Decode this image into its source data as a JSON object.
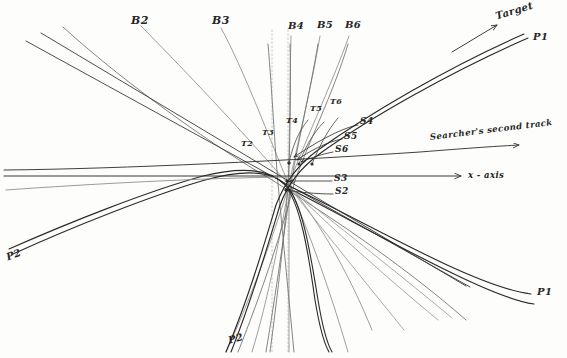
{
  "figure": {
    "kind": "hand-drawn-diagram",
    "background_color": "#fdfdfc",
    "ink_color": "#2a2a2a",
    "faint_ink_color": "#8d8d8d",
    "dotted_ink_color": "#b0b0b0",
    "width": 567,
    "height": 358
  },
  "labels": {
    "bearings": [
      {
        "name": "B2",
        "text": "B2",
        "x": 131,
        "y": 14
      },
      {
        "name": "B3",
        "text": "B3",
        "x": 212,
        "y": 14
      },
      {
        "name": "B4",
        "text": "B4",
        "x": 288,
        "y": 24
      },
      {
        "name": "B5",
        "text": "B5",
        "x": 317,
        "y": 23
      },
      {
        "name": "B6",
        "text": "B6",
        "x": 345,
        "y": 23
      }
    ],
    "tracks": [
      {
        "name": "T2",
        "text": "T2",
        "x": 241,
        "y": 143
      },
      {
        "name": "T3",
        "text": "T3",
        "x": 262,
        "y": 132
      },
      {
        "name": "T4",
        "text": "T4",
        "x": 286,
        "y": 120
      },
      {
        "name": "T5",
        "text": "T5",
        "x": 310,
        "y": 108
      },
      {
        "name": "T6",
        "text": "T6",
        "x": 330,
        "y": 101
      }
    ],
    "searcher_points": [
      {
        "name": "S4",
        "text": "S4",
        "x": 360,
        "y": 121
      },
      {
        "name": "S5",
        "text": "S5",
        "x": 344,
        "y": 136
      },
      {
        "name": "S6",
        "text": "S6",
        "x": 335,
        "y": 149
      },
      {
        "name": "S3",
        "text": "S3",
        "x": 334,
        "y": 178
      },
      {
        "name": "S2",
        "text": "S2",
        "x": 335,
        "y": 191
      }
    ],
    "curves": [
      {
        "name": "P1-upper",
        "text": "P1",
        "x": 533,
        "y": 36
      },
      {
        "name": "P1-lower",
        "text": "P1",
        "x": 537,
        "y": 291
      },
      {
        "name": "P2-left",
        "text": "P2",
        "x": 6,
        "y": 254
      },
      {
        "name": "P2-bottom",
        "text": "P2",
        "x": 228,
        "y": 338
      }
    ],
    "annotations": [
      {
        "name": "target-label",
        "text": "Target",
        "x": 495,
        "y": 10
      },
      {
        "name": "searcher-second-track-label",
        "text": "Searcher's second track",
        "x": 432,
        "y": 137
      },
      {
        "name": "x-axis-label",
        "text": "x - axis",
        "x": 470,
        "y": 170
      }
    ]
  },
  "geometry": {
    "convergence_point": {
      "x": 288,
      "y": 185
    },
    "x_axis_y": 176,
    "searcher_track_y_left": 170,
    "searcher_track_y_right": 147,
    "dotted_verticals_x": [
      272,
      288
    ],
    "notes": "Fan of bearing lines B2..B6 from upper area, target tracks T2..T6, searcher marks S2..S6, and hyperbola-like P1/P2 curve pairs."
  }
}
